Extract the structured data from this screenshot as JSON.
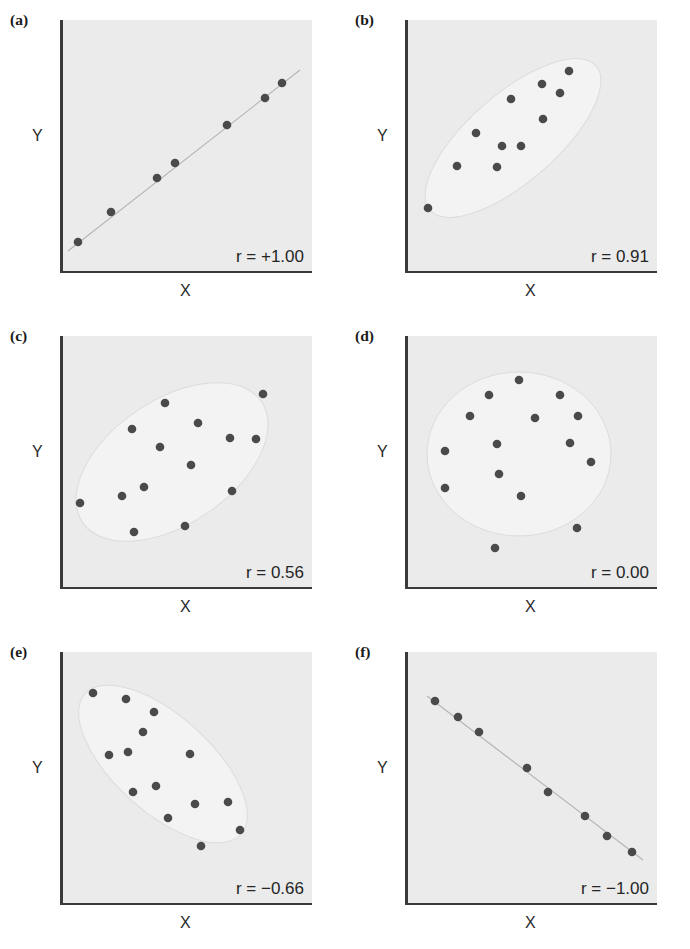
{
  "figure": {
    "axis_x_label": "X",
    "axis_y_label": "Y",
    "background_color": "#ebebeb",
    "dot_color": "#4a4a4a",
    "axis_color": "#3a3a3a",
    "blob_color": "#f3f3f3"
  },
  "panels": [
    {
      "tag": "(a)",
      "r_label": "r = +1.00",
      "r_value": 1.0,
      "xlabel": "X",
      "ylabel": "Y",
      "has_blob": false,
      "has_line": true
    },
    {
      "tag": "(b)",
      "r_label": "r = 0.91",
      "r_value": 0.91,
      "xlabel": "X",
      "ylabel": "Y",
      "has_blob": true,
      "has_line": false
    },
    {
      "tag": "(c)",
      "r_label": "r = 0.56",
      "r_value": 0.56,
      "xlabel": "X",
      "ylabel": "Y",
      "has_blob": true,
      "has_line": false
    },
    {
      "tag": "(d)",
      "r_label": "r = 0.00",
      "r_value": 0.0,
      "xlabel": "X",
      "ylabel": "Y",
      "has_blob": true,
      "has_line": false
    },
    {
      "tag": "(e)",
      "r_label": "r = −0.66",
      "r_value": -0.66,
      "xlabel": "X",
      "ylabel": "Y",
      "has_blob": true,
      "has_line": false
    },
    {
      "tag": "(f)",
      "r_label": "r = −1.00",
      "r_value": -1.0,
      "xlabel": "X",
      "ylabel": "Y",
      "has_blob": false,
      "has_line": true
    }
  ],
  "chart_data": [
    {
      "type": "scatter",
      "panel": "(a)",
      "title": "r = +1.00",
      "xlabel": "X",
      "ylabel": "Y",
      "xlim": [
        0,
        252
      ],
      "ylim": [
        0,
        253
      ],
      "grid": false,
      "legend": "none",
      "annotation": "r = +1.00",
      "n_points": 7,
      "points": [
        [
          18,
          222
        ],
        [
          51,
          192
        ],
        [
          97,
          158
        ],
        [
          115,
          143
        ],
        [
          167,
          105
        ],
        [
          205,
          78
        ],
        [
          222,
          63
        ]
      ],
      "trend_line": [
        [
          8,
          231
        ],
        [
          240,
          50
        ]
      ]
    },
    {
      "type": "scatter",
      "panel": "(b)",
      "title": "r = 0.91",
      "xlabel": "X",
      "ylabel": "Y",
      "xlim": [
        0,
        252
      ],
      "ylim": [
        0,
        253
      ],
      "grid": false,
      "legend": "none",
      "annotation": "r = 0.91",
      "n_points": 11,
      "points": [
        [
          23,
          188
        ],
        [
          52,
          146
        ],
        [
          92,
          147
        ],
        [
          71,
          113
        ],
        [
          97,
          126
        ],
        [
          106,
          79
        ],
        [
          116,
          126
        ],
        [
          137,
          64
        ],
        [
          138,
          99
        ],
        [
          155,
          73
        ],
        [
          164,
          51
        ]
      ],
      "ellipse": {
        "cx": 108,
        "cy": 118,
        "rx": 110,
        "ry": 44,
        "rotate": -41
      }
    },
    {
      "type": "scatter",
      "panel": "(c)",
      "title": "r = 0.56",
      "xlabel": "X",
      "ylabel": "Y",
      "xlim": [
        0,
        252
      ],
      "ylim": [
        0,
        253
      ],
      "grid": false,
      "legend": "none",
      "annotation": "r = 0.56",
      "n_points": 14,
      "points": [
        [
          20,
          167
        ],
        [
          62,
          160
        ],
        [
          72,
          93
        ],
        [
          74,
          196
        ],
        [
          84,
          151
        ],
        [
          100,
          111
        ],
        [
          105,
          67
        ],
        [
          125,
          190
        ],
        [
          131,
          129
        ],
        [
          138,
          87
        ],
        [
          170,
          102
        ],
        [
          172,
          155
        ],
        [
          196,
          103
        ],
        [
          203,
          58
        ]
      ],
      "ellipse": {
        "cx": 112,
        "cy": 126,
        "rx": 108,
        "ry": 62,
        "rotate": -34
      }
    },
    {
      "type": "scatter",
      "panel": "(d)",
      "title": "r = 0.00",
      "xlabel": "X",
      "ylabel": "Y",
      "xlim": [
        0,
        252
      ],
      "ylim": [
        0,
        253
      ],
      "grid": false,
      "legend": "none",
      "annotation": "r = 0.00",
      "n_points": 15,
      "points": [
        [
          40,
          115
        ],
        [
          40,
          152
        ],
        [
          65,
          80
        ],
        [
          84,
          59
        ],
        [
          92,
          108
        ],
        [
          94,
          138
        ],
        [
          90,
          212
        ],
        [
          114,
          44
        ],
        [
          116,
          160
        ],
        [
          130,
          82
        ],
        [
          155,
          59
        ],
        [
          165,
          107
        ],
        [
          173,
          80
        ],
        [
          172,
          192
        ],
        [
          186,
          126
        ]
      ],
      "ellipse": {
        "cx": 114,
        "cy": 118,
        "rx": 92,
        "ry": 82,
        "rotate": 0
      }
    },
    {
      "type": "scatter",
      "panel": "(e)",
      "title": "r = -0.66",
      "xlabel": "X",
      "ylabel": "Y",
      "xlim": [
        0,
        252
      ],
      "ylim": [
        0,
        253
      ],
      "grid": false,
      "legend": "none",
      "annotation": "r = −0.66",
      "n_points": 14,
      "points": [
        [
          33,
          41
        ],
        [
          66,
          47
        ],
        [
          49,
          103
        ],
        [
          68,
          100
        ],
        [
          83,
          80
        ],
        [
          94,
          60
        ],
        [
          73,
          140
        ],
        [
          96,
          134
        ],
        [
          130,
          102
        ],
        [
          108,
          166
        ],
        [
          135,
          152
        ],
        [
          141,
          194
        ],
        [
          168,
          150
        ],
        [
          180,
          178
        ]
      ],
      "ellipse": {
        "cx": 103,
        "cy": 112,
        "rx": 105,
        "ry": 48,
        "rotate": 42
      }
    },
    {
      "type": "scatter",
      "panel": "(f)",
      "title": "r = -1.00",
      "xlabel": "X",
      "ylabel": "Y",
      "xlim": [
        0,
        252
      ],
      "ylim": [
        0,
        253
      ],
      "grid": false,
      "legend": "none",
      "annotation": "r = −1.00",
      "n_points": 8,
      "points": [
        [
          30,
          49
        ],
        [
          53,
          65
        ],
        [
          74,
          80
        ],
        [
          122,
          116
        ],
        [
          143,
          140
        ],
        [
          180,
          164
        ],
        [
          202,
          184
        ],
        [
          227,
          200
        ]
      ],
      "trend_line": [
        [
          22,
          44
        ],
        [
          238,
          208
        ]
      ]
    }
  ]
}
